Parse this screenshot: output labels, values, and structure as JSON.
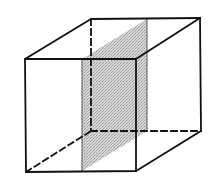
{
  "diagram": {
    "type": "cube-with-cross-section",
    "colors": {
      "edge": "#111111",
      "plane_fill": "#c8c8c8",
      "background": "#ffffff"
    },
    "front_face": {
      "tl": [
        25,
        59
      ],
      "tr": [
        136,
        59
      ],
      "br": [
        136,
        171
      ],
      "bl": [
        26,
        172
      ]
    },
    "back_face": {
      "tl": [
        91,
        19
      ],
      "tr": [
        200,
        18
      ],
      "br": [
        201,
        131
      ],
      "bl": [
        91,
        131
      ]
    },
    "hidden_edges": [
      "back-left-vertical",
      "back-bottom-horizontal",
      "bottom-left-depth"
    ],
    "shaded_plane": {
      "front_top": [
        82,
        59
      ],
      "back_top": [
        147,
        19
      ],
      "back_bottom": [
        147,
        131
      ],
      "front_bottom": [
        82,
        171
      ]
    }
  }
}
